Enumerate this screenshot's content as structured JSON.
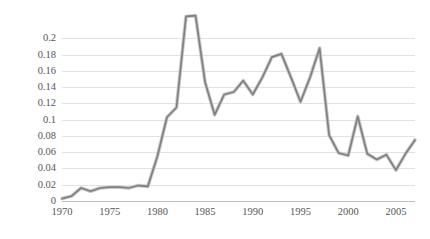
{
  "chart_data": {
    "type": "line",
    "title": "",
    "subtitle": "",
    "xlabel": "",
    "ylabel": "Per 100,000 people",
    "xlim": [
      1970,
      2007
    ],
    "ylim": [
      0,
      0.23
    ],
    "grid": true,
    "legend": null,
    "legend_position": "none",
    "line_color": "#808080",
    "series_name": "Rate per 100,000 people",
    "y_ticks": [
      0,
      0.02,
      0.04,
      0.06,
      0.08,
      0.1,
      0.12,
      0.14,
      0.16,
      0.18,
      0.2
    ],
    "y_tick_labels": [
      "0",
      "0.02",
      "0.04",
      "0.06",
      "0.08",
      "0.1",
      "0.12",
      "0.14",
      "0.16",
      "0.18",
      "0.2"
    ],
    "x_ticks": [
      1970,
      1975,
      1980,
      1985,
      1990,
      1995,
      2000,
      2005
    ],
    "x_tick_labels": [
      "1970",
      "1975",
      "1980",
      "1985",
      "1990",
      "1995",
      "2000",
      "2005"
    ],
    "x": [
      1970,
      1971,
      1972,
      1973,
      1974,
      1975,
      1976,
      1977,
      1978,
      1979,
      1980,
      1981,
      1982,
      1983,
      1984,
      1985,
      1986,
      1987,
      1988,
      1989,
      1990,
      1991,
      1992,
      1993,
      1994,
      1995,
      1996,
      1997,
      1998,
      1999,
      2000,
      2001,
      2002,
      2003,
      2004,
      2005,
      2006,
      2007
    ],
    "values": [
      0.003,
      0.006,
      0.016,
      0.012,
      0.016,
      0.017,
      0.017,
      0.016,
      0.019,
      0.018,
      0.055,
      0.103,
      0.115,
      0.227,
      0.228,
      0.146,
      0.106,
      0.131,
      0.134,
      0.148,
      0.131,
      0.152,
      0.177,
      0.181,
      0.152,
      0.122,
      0.152,
      0.188,
      0.081,
      0.059,
      0.056,
      0.104,
      0.058,
      0.051,
      0.057,
      0.038,
      0.058,
      0.075
    ]
  }
}
